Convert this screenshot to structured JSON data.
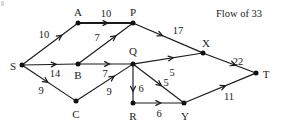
{
  "caption": {
    "text": "Flow of 33",
    "x": 239,
    "y": 14
  },
  "graph": {
    "type": "directed-network-flow",
    "nodes": [
      {
        "id": "S",
        "label": "S",
        "x": 22,
        "y": 65,
        "label_x": 13,
        "label_y": 66
      },
      {
        "id": "A",
        "label": "A",
        "x": 78,
        "y": 23,
        "label_x": 78,
        "label_y": 12
      },
      {
        "id": "P",
        "label": "P",
        "x": 133,
        "y": 23,
        "label_x": 133,
        "label_y": 12
      },
      {
        "id": "B",
        "label": "B",
        "x": 78,
        "y": 64,
        "label_x": 78,
        "label_y": 75
      },
      {
        "id": "C",
        "label": "C",
        "x": 76,
        "y": 101,
        "label_x": 76,
        "label_y": 114
      },
      {
        "id": "Q",
        "label": "Q",
        "x": 133,
        "y": 64,
        "label_x": 133,
        "label_y": 51
      },
      {
        "id": "R",
        "label": "R",
        "x": 133,
        "y": 103,
        "label_x": 133,
        "label_y": 116
      },
      {
        "id": "X",
        "label": "X",
        "x": 203,
        "y": 53,
        "label_x": 206,
        "label_y": 43
      },
      {
        "id": "Y",
        "label": "Y",
        "x": 184,
        "y": 103,
        "label_x": 185,
        "label_y": 116
      },
      {
        "id": "T",
        "label": "T",
        "x": 256,
        "y": 73,
        "label_x": 266,
        "label_y": 74
      }
    ],
    "edges": [
      {
        "from": "S",
        "to": "A",
        "flow": "10",
        "label_x": 44,
        "label_y": 35,
        "thick": false,
        "arrow_t": 0.72
      },
      {
        "from": "S",
        "to": "B",
        "flow": "14",
        "label_x": 55,
        "label_y": 74,
        "thick": false,
        "arrow_t": 0.62
      },
      {
        "from": "S",
        "to": "C",
        "flow": "9",
        "label_x": 41,
        "label_y": 91,
        "thick": false,
        "arrow_t": 0.48
      },
      {
        "from": "A",
        "to": "P",
        "flow": "10",
        "label_x": 106,
        "label_y": 14,
        "thick": true,
        "arrow_t": 0.55
      },
      {
        "from": "B",
        "to": "P",
        "flow": "7",
        "label_x": 97,
        "label_y": 38,
        "thick": false,
        "arrow_t": 0.7
      },
      {
        "from": "B",
        "to": "Q",
        "flow": "7",
        "label_x": 105,
        "label_y": 74,
        "thick": false,
        "arrow_t": 0.58
      },
      {
        "from": "C",
        "to": "Q",
        "flow": "9",
        "label_x": 109,
        "label_y": 92,
        "thick": false,
        "arrow_t": 0.68
      },
      {
        "from": "P",
        "to": "X",
        "flow": "17",
        "label_x": 178,
        "label_y": 31,
        "thick": false,
        "arrow_t": 0.42
      },
      {
        "from": "Q",
        "to": "X",
        "flow": "5",
        "label_x": 172,
        "label_y": 73,
        "thick": false,
        "arrow_t": 0.58
      },
      {
        "from": "Q",
        "to": "R",
        "flow": "6",
        "label_x": 141,
        "label_y": 89,
        "thick": false,
        "arrow_t": 0.72
      },
      {
        "from": "Q",
        "to": "Y",
        "flow": "5",
        "label_x": 166,
        "label_y": 83,
        "thick": false,
        "arrow_t": 0.56
      },
      {
        "from": "R",
        "to": "Y",
        "flow": "6",
        "label_x": 159,
        "label_y": 114,
        "thick": false,
        "arrow_t": 0.55
      },
      {
        "from": "X",
        "to": "T",
        "flow": "22",
        "label_x": 238,
        "label_y": 62,
        "thick": false,
        "arrow_t": 0.62
      },
      {
        "from": "Y",
        "to": "T",
        "flow": "11",
        "label_x": 229,
        "label_y": 97,
        "thick": false,
        "arrow_t": 0.58
      }
    ]
  }
}
